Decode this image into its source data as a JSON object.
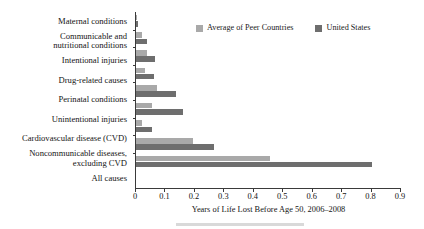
{
  "chart_data": {
    "type": "bar",
    "orientation": "horizontal",
    "title": "",
    "xlabel": "Years of Life Lost Before Age 50, 2006–2008",
    "ylabel": "",
    "xlim": [
      0,
      0.9
    ],
    "xticks": [
      0,
      0.1,
      0.2,
      0.3,
      0.4,
      0.5,
      0.6,
      0.7,
      0.8,
      0.9
    ],
    "xtick_labels": [
      "0",
      "0.1",
      "0.2",
      "0.3",
      "0.4",
      "0.5",
      "0.6",
      "0.7",
      "0.8",
      "0.9"
    ],
    "grid": false,
    "legend_position": "top-right",
    "categories": [
      "Maternal conditions",
      "Communicable and nutritional conditions",
      "Intentional injuries",
      "Drug-related causes",
      "Perinatal conditions",
      "Unintentional injuries",
      "Cardiovascular disease (CVD)",
      "Noncommunicable diseases, excluding CVD",
      "All causes"
    ],
    "category_label_lines": [
      [
        "Maternal conditions"
      ],
      [
        "Communicable and",
        "nutritional conditions"
      ],
      [
        "Intentional injuries"
      ],
      [
        "Drug-related causes"
      ],
      [
        "Perinatal conditions"
      ],
      [
        "Unintentional injuries"
      ],
      [
        "Cardiovascular disease (CVD)"
      ],
      [
        "Noncommunicable diseases,",
        "excluding CVD"
      ],
      [
        "All causes"
      ]
    ],
    "series": [
      {
        "name": "Average of Peer Countries",
        "color": "#a9a9a9",
        "values": [
          0.003,
          0.022,
          0.037,
          0.03,
          0.072,
          0.053,
          0.022,
          0.195,
          0.455
        ]
      },
      {
        "name": "United States",
        "color": "#6e6e6e",
        "values": [
          0.006,
          0.037,
          0.063,
          0.06,
          0.135,
          0.158,
          0.054,
          0.265,
          0.8
        ]
      }
    ]
  },
  "legend": {
    "entries": [
      {
        "label": "Average of Peer Countries",
        "color": "#a9a9a9"
      },
      {
        "label": "United States",
        "color": "#6e6e6e"
      }
    ]
  }
}
